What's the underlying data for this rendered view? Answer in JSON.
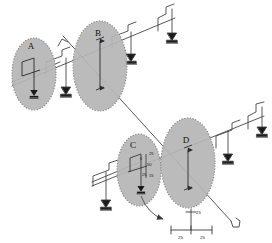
{
  "drawing": {
    "title": "Structural detail drawing with callout regions",
    "canvas": {
      "width": 272,
      "height": 243
    },
    "colors": {
      "background": "#ffffff",
      "line": "#3b3b3b",
      "line_light": "#5a5a5a",
      "ellipse_fill": "#b5b5b5",
      "ellipse_stroke": "#8a8a8a",
      "anchor": "#1a1a1a",
      "label_text": "#111111",
      "dim_text": "#222222"
    },
    "detail_regions": [
      {
        "id": "A",
        "label": "A",
        "cx": 34,
        "cy": 74,
        "rx": 22,
        "ry": 36
      },
      {
        "id": "B",
        "label": "B",
        "cx": 100,
        "cy": 66,
        "rx": 27,
        "ry": 45
      },
      {
        "id": "C",
        "label": "C",
        "cx": 139,
        "cy": 170,
        "rx": 22,
        "ry": 36
      },
      {
        "id": "D",
        "label": "D",
        "cx": 188,
        "cy": 163,
        "rx": 27,
        "ry": 45
      }
    ],
    "dimension_labels": [
      {
        "id": "c-top",
        "text": "25",
        "x": 149,
        "y": 155
      },
      {
        "id": "c-mid",
        "text": "50",
        "x": 147,
        "y": 166
      },
      {
        "id": "c-low",
        "text": "25",
        "x": 144,
        "y": 175
      },
      {
        "id": "c-low2",
        "text": "15",
        "x": 149,
        "y": 176
      }
    ],
    "callout_detail": {
      "name": "t-section-detail",
      "labels": [
        {
          "id": "vertical",
          "text": "25",
          "x": 196,
          "y": 214
        },
        {
          "id": "left-flange",
          "text": "25",
          "x": 179,
          "y": 238
        },
        {
          "id": "right-flange",
          "text": "25",
          "x": 202,
          "y": 238
        }
      ]
    },
    "assemblies": [
      {
        "id": "upper",
        "name": "upper-beam-assembly",
        "supports": 4
      },
      {
        "id": "lower",
        "name": "lower-beam-assembly",
        "supports": 4
      }
    ],
    "section_line": {
      "name": "section-cut-line",
      "from": [
        63,
        36
      ],
      "to": [
        236,
        226
      ]
    }
  }
}
